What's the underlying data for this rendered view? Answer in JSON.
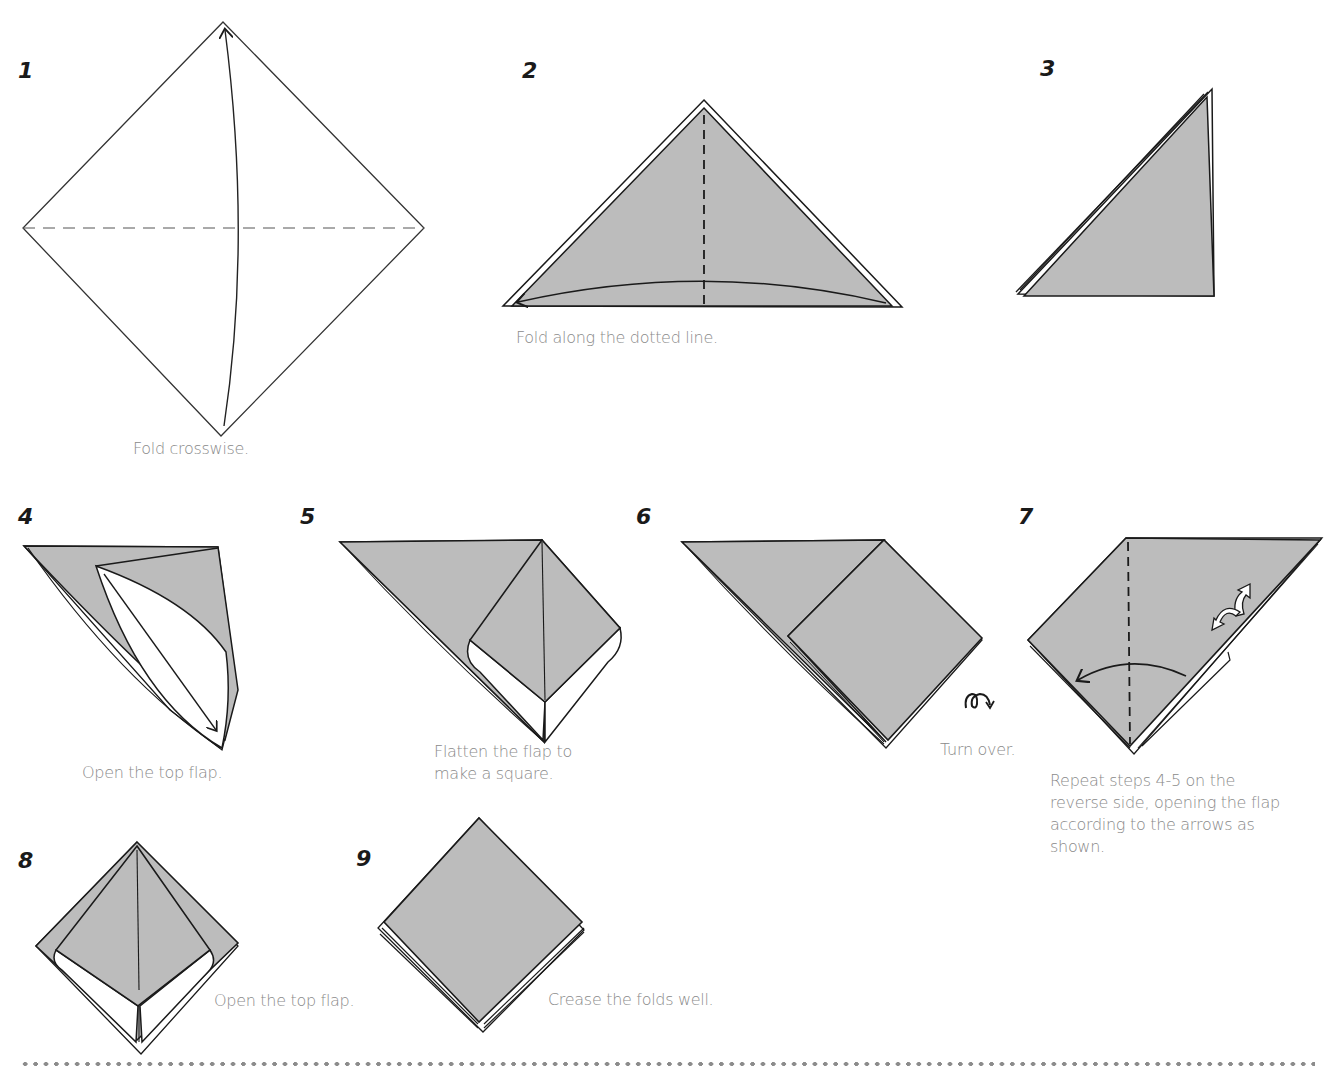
{
  "document": {
    "type": "origami-instructions",
    "paper_color": "#bcbcbc",
    "line_color": "#1a1a1a",
    "caption_color": "#8a8a8a"
  },
  "steps": [
    {
      "number": "1",
      "caption": "Fold crosswise."
    },
    {
      "number": "2",
      "caption": "Fold along the dotted line."
    },
    {
      "number": "3",
      "caption": ""
    },
    {
      "number": "4",
      "caption": "Open the top flap."
    },
    {
      "number": "5",
      "caption_lines": [
        "Flatten the flap to",
        "make a square."
      ]
    },
    {
      "number": "6",
      "caption": "Turn over.",
      "symbol": "turn-over-icon"
    },
    {
      "number": "7",
      "caption_lines": [
        "Repeat steps 4-5 on the",
        "reverse side, opening the flap",
        "according to the arrows as",
        "shown."
      ]
    },
    {
      "number": "8",
      "caption": "Open the top flap."
    },
    {
      "number": "9",
      "caption": "Crease the folds well."
    }
  ]
}
